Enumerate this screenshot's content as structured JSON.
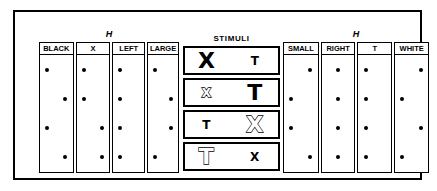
{
  "figure": {
    "left_panel": {
      "title": "H",
      "columns": [
        {
          "header": "BLACK",
          "dots": [
            "L",
            "R",
            "L",
            "R"
          ]
        },
        {
          "header": "X",
          "dots": [
            "L",
            "L",
            "R",
            "R"
          ]
        },
        {
          "header": "LEFT",
          "dots": [
            "L",
            "L",
            "L",
            "L"
          ]
        },
        {
          "header": "LARGE",
          "dots": [
            "L",
            "R",
            "R",
            "L"
          ]
        }
      ]
    },
    "stimuli_panel": {
      "title": "STIMULI",
      "rows": [
        {
          "left": {
            "char": "X",
            "size": "big",
            "fill": "filled"
          },
          "right": {
            "char": "T",
            "size": "small",
            "fill": "filled"
          }
        },
        {
          "left": {
            "char": "X",
            "size": "small",
            "fill": "outline"
          },
          "right": {
            "char": "T",
            "size": "big",
            "fill": "filled"
          }
        },
        {
          "left": {
            "char": "T",
            "size": "small",
            "fill": "filled"
          },
          "right": {
            "char": "X",
            "size": "big",
            "fill": "outline"
          }
        },
        {
          "left": {
            "char": "T",
            "size": "big",
            "fill": "outline"
          },
          "right": {
            "char": "X",
            "size": "small",
            "fill": "filled"
          }
        }
      ]
    },
    "right_panel": {
      "title": "H",
      "columns": [
        {
          "header": "SMALL",
          "dots": [
            "R",
            "L",
            "L",
            "R"
          ]
        },
        {
          "header": "RIGHT",
          "dots": [
            "C",
            "C",
            "C",
            "C"
          ]
        },
        {
          "header": "T",
          "dots": [
            "L",
            "L",
            "L",
            "L"
          ]
        },
        {
          "header": "WHITE",
          "dots": [
            "R",
            "L",
            "R",
            "L"
          ]
        }
      ]
    },
    "colors": {
      "ink": "#000000",
      "paper": "#ffffff"
    }
  }
}
